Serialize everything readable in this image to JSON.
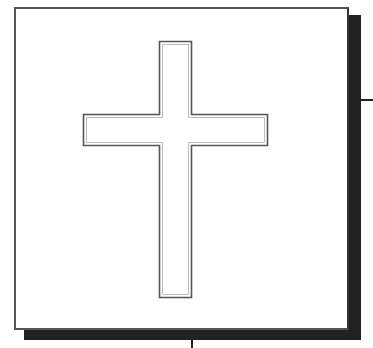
{
  "figure": {
    "colors": {
      "background": "#ffffff",
      "frame_border": "#555555",
      "shadow": "#222222",
      "cross_outer_stroke": "#555555",
      "cross_inner_stroke": "#bbbbbb"
    },
    "frame": {
      "x": 14,
      "y": 7,
      "width": 335,
      "height": 323
    },
    "cross": {
      "stem": {
        "x": 159,
        "y": 41,
        "width": 33,
        "height": 256
      },
      "arms": {
        "x": 83,
        "y": 114,
        "width": 185,
        "height": 32
      }
    },
    "ticks": [
      {
        "orientation": "horizontal",
        "x": 361,
        "y": 100,
        "length": 12
      },
      {
        "orientation": "vertical",
        "x": 191,
        "y": 340,
        "length": 8
      }
    ]
  }
}
